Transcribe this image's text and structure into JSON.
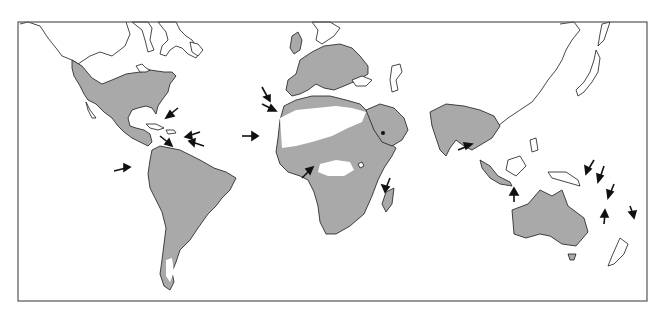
{
  "map": {
    "type": "world-distribution-map",
    "projection": "equatorial cylindrical",
    "frame": {
      "x": 18,
      "y": 22,
      "width": 629,
      "height": 279
    },
    "colors": {
      "background": "#ffffff",
      "land_outline": "#1a1a1a",
      "distribution_shade": "#a9a9a9",
      "arrow": "#111111",
      "frame": "#555555"
    },
    "shaded_regions": [
      "North America (USA, Mexico, Central America)",
      "South America",
      "Europe",
      "North Africa coast",
      "Sahel / Central Africa",
      "Southern Africa",
      "Arabian Peninsula",
      "Indian subcontinent and Southeast Asia",
      "Sumatra / Java",
      "Madagascar",
      "Australia",
      "Tasmania"
    ],
    "arrows": [
      {
        "id": "caribbean-bahamas",
        "tip": [
          170,
          115
        ],
        "dir": "sw"
      },
      {
        "id": "caribbean-lesser-antilles-1",
        "tip": [
          188,
          135
        ],
        "dir": "w"
      },
      {
        "id": "caribbean-lesser-antilles-2",
        "tip": [
          190,
          142
        ],
        "dir": "w"
      },
      {
        "id": "caribbean-trinidad",
        "tip": [
          168,
          143
        ],
        "dir": "se"
      },
      {
        "id": "galapagos",
        "tip": [
          128,
          170
        ],
        "dir": "e"
      },
      {
        "id": "atlantic-azores",
        "tip": [
          265,
          98
        ],
        "dir": "se"
      },
      {
        "id": "atlantic-canaries",
        "tip": [
          273,
          108
        ],
        "dir": "se"
      },
      {
        "id": "atlantic-cape-verde",
        "tip": [
          256,
          137
        ],
        "dir": "e"
      },
      {
        "id": "gulf-of-guinea",
        "tip": [
          310,
          168
        ],
        "dir": "ne"
      },
      {
        "id": "comoros",
        "tip": [
          385,
          190
        ],
        "dir": "s"
      },
      {
        "id": "sri-lanka",
        "tip": [
          470,
          145
        ],
        "dir": "e"
      },
      {
        "id": "lesser-sunda",
        "tip": [
          514,
          188
        ],
        "dir": "n"
      },
      {
        "id": "solomons",
        "tip": [
          585,
          172
        ],
        "dir": "sw"
      },
      {
        "id": "vanuatu",
        "tip": [
          598,
          180
        ],
        "dir": "sw"
      },
      {
        "id": "new-caledonia",
        "tip": [
          608,
          196
        ],
        "dir": "sw"
      },
      {
        "id": "norfolk",
        "tip": [
          605,
          210
        ],
        "dir": "n"
      },
      {
        "id": "fiji",
        "tip": [
          632,
          205
        ],
        "dir": "s"
      }
    ],
    "markers": [
      {
        "id": "arabia-dot",
        "pos": [
          383,
          133
        ]
      }
    ]
  }
}
